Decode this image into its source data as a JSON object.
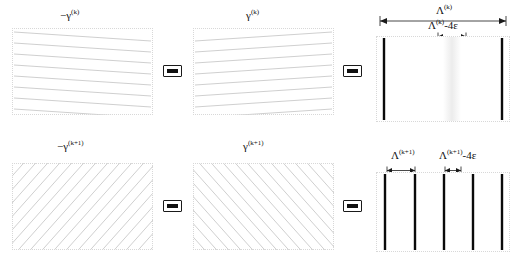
{
  "figure": {
    "ink_color": "#101010",
    "fringe_color": "#0a0a0a",
    "grating_line_color": "#c9c9c9",
    "frame_color": "#d8d8d8"
  },
  "rows": [
    {
      "id": "row-k",
      "superscript": "(k)",
      "left_panel": {
        "label_prefix": "−",
        "label_symbol": "γ",
        "label_sup": "(k)",
        "pattern": "near-horizontal-lines-down-right",
        "line_count": 8,
        "slope_deg": -4.5
      },
      "middle_panel": {
        "label_prefix": "",
        "label_symbol": "γ",
        "label_sup": "(k)",
        "pattern": "near-horizontal-lines-up-right",
        "line_count": 8,
        "slope_deg": 4.5
      },
      "operator_1": "minus",
      "operator_2": "minus",
      "result_panel": {
        "fringe_count": 2,
        "fringe_positions_pct": [
          6,
          94
        ],
        "has_faint_band": true,
        "faint_band_center_pct": 56,
        "faint_band_width_pct": 13
      },
      "dim_outer": {
        "symbol": "Λ",
        "sup": "(k)",
        "suffix": "",
        "span_pct": [
          6,
          94
        ]
      },
      "dim_inner": {
        "symbol": "Λ",
        "sup": "(k)",
        "suffix": "-4ε",
        "span_pct": [
          45,
          68
        ]
      }
    },
    {
      "id": "row-k-plus-1",
      "superscript": "(k+1)",
      "left_panel": {
        "label_prefix": "−",
        "label_symbol": "γ",
        "label_sup": "(k+1)",
        "pattern": "steep-diagonals-up-right",
        "line_count": 26,
        "slope_deg": 42
      },
      "middle_panel": {
        "label_prefix": "",
        "label_symbol": "γ",
        "label_sup": "(k+1)",
        "pattern": "steep-diagonals-down-right",
        "line_count": 26,
        "slope_deg": -42
      },
      "operator_1": "minus",
      "operator_2": "minus",
      "result_panel": {
        "fringe_count": 5,
        "fringe_positions_pct": [
          7,
          29,
          51,
          72,
          94
        ],
        "has_faint_band": false
      },
      "dim_outer": {
        "symbol": "Λ",
        "sup": "(k+1)",
        "suffix": "",
        "span_pct": [
          7,
          29
        ]
      },
      "dim_inner": {
        "symbol": "Λ",
        "sup": "(k+1)",
        "suffix": "-4ε",
        "span_pct": [
          51,
          62
        ]
      }
    }
  ]
}
